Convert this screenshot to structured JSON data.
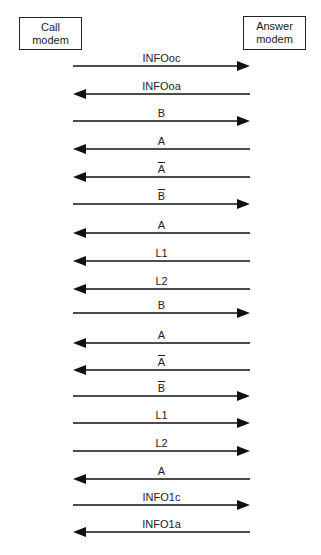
{
  "participants": {
    "call": {
      "line1": "Call",
      "line2": "modem"
    },
    "answer": {
      "line1": "Answer",
      "line2": "modem"
    }
  },
  "messages": [
    {
      "label": "INFOoc",
      "overbar": false,
      "direction": "right",
      "y": 66
    },
    {
      "label": "INFOoa",
      "overbar": false,
      "direction": "left",
      "y": 94
    },
    {
      "label": "B",
      "overbar": false,
      "direction": "right",
      "y": 121
    },
    {
      "label": "A",
      "overbar": false,
      "direction": "left",
      "y": 149
    },
    {
      "label": "A",
      "overbar": true,
      "direction": "left",
      "y": 177
    },
    {
      "label": "B",
      "overbar": true,
      "direction": "right",
      "y": 204
    },
    {
      "label": "A",
      "overbar": false,
      "direction": "left",
      "y": 233
    },
    {
      "label": "L1",
      "overbar": false,
      "direction": "left",
      "y": 261
    },
    {
      "label": "L2",
      "overbar": false,
      "direction": "left",
      "y": 289
    },
    {
      "label": "B",
      "overbar": false,
      "direction": "right",
      "y": 313
    },
    {
      "label": "A",
      "overbar": false,
      "direction": "left",
      "y": 343
    },
    {
      "label": "A",
      "overbar": true,
      "direction": "left",
      "y": 370
    },
    {
      "label": "B",
      "overbar": true,
      "direction": "right",
      "y": 396
    },
    {
      "label": "L1",
      "overbar": false,
      "direction": "right",
      "y": 423
    },
    {
      "label": "L2",
      "overbar": false,
      "direction": "right",
      "y": 451
    },
    {
      "label": "A",
      "overbar": false,
      "direction": "left",
      "y": 479
    },
    {
      "label": "INFO1c",
      "overbar": false,
      "direction": "right",
      "y": 505
    },
    {
      "label": "INFO1a",
      "overbar": false,
      "direction": "left",
      "y": 532
    }
  ],
  "colors": {
    "line": "#111111",
    "text": "#222222"
  }
}
